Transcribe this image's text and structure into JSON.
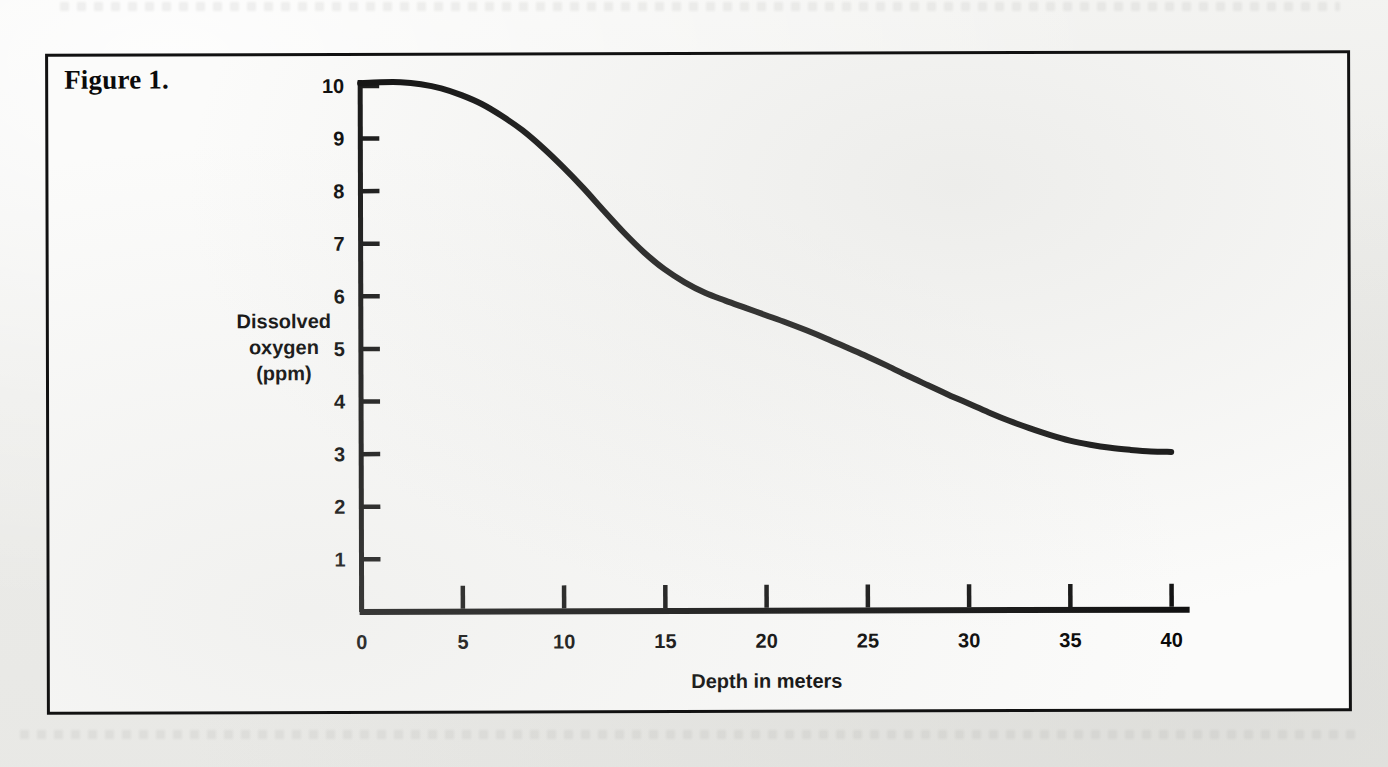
{
  "page": {
    "background_color": "#efefed",
    "paper_color": "#fbfbfa",
    "ink_color": "#111111"
  },
  "figure": {
    "caption": "Figure 1.",
    "border_color": "#111111"
  },
  "chart_data": {
    "type": "line",
    "title": "Figure 1.",
    "subtitle": "",
    "xlabel": "Depth in meters",
    "ylabel": "Dissolved oxygen (ppm)",
    "ylabel_lines": [
      "Dissolved",
      "oxygen",
      "(ppm)"
    ],
    "xlim": [
      0,
      40
    ],
    "ylim": [
      0,
      10.4
    ],
    "xticks": [
      0,
      5,
      10,
      15,
      20,
      25,
      30,
      35,
      40
    ],
    "xtick_labels": [
      "0",
      "5",
      "10",
      "15",
      "20",
      "25",
      "30",
      "35",
      "40"
    ],
    "yticks": [
      1,
      2,
      3,
      4,
      5,
      6,
      7,
      8,
      9,
      10
    ],
    "ytick_labels": [
      "1",
      "2",
      "3",
      "4",
      "5",
      "6",
      "7",
      "8",
      "9",
      "10"
    ],
    "grid": false,
    "legend": null,
    "tick_direction": "in",
    "line_color": "#0a0a0a",
    "line_width_px": 6,
    "series": [
      {
        "name": "Dissolved oxygen",
        "x": [
          0,
          1,
          2,
          3,
          4,
          5,
          6,
          7,
          8,
          9,
          10,
          11,
          12,
          13,
          14,
          15,
          16,
          17,
          18,
          19,
          20,
          21,
          22,
          23,
          24,
          25,
          26,
          27,
          28,
          29,
          30,
          31,
          32,
          33,
          34,
          35,
          36,
          37,
          38,
          39,
          40
        ],
        "y": [
          10.05,
          10.07,
          10.07,
          10.03,
          9.95,
          9.82,
          9.65,
          9.42,
          9.15,
          8.82,
          8.45,
          8.05,
          7.62,
          7.2,
          6.82,
          6.5,
          6.25,
          6.05,
          5.9,
          5.76,
          5.62,
          5.48,
          5.33,
          5.17,
          5.0,
          4.83,
          4.65,
          4.46,
          4.28,
          4.1,
          3.93,
          3.76,
          3.6,
          3.46,
          3.33,
          3.22,
          3.14,
          3.08,
          3.04,
          3.01,
          3.0
        ]
      }
    ],
    "annotations": []
  }
}
